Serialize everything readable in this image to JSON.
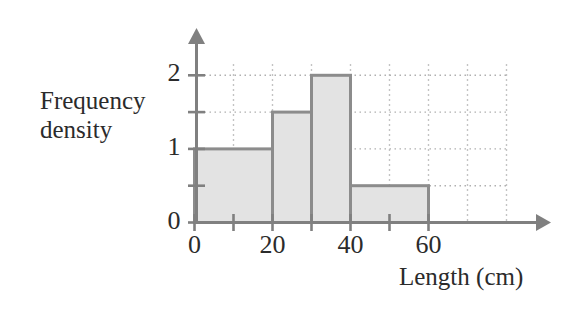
{
  "figure": {
    "background_color": "#ffffff",
    "axis_color": "#808080",
    "grid_color": "#b0b0b0",
    "bar_fill_color": "#e3e3e3",
    "bar_border_color": "#8c8c8c",
    "text_color": "#2b2b2b"
  },
  "labels": {
    "y_axis_title_line1": "Frequency",
    "y_axis_title_line2": "density",
    "x_axis_title": "Length (cm)"
  },
  "chart_data": {
    "type": "bar",
    "title": "",
    "xlabel": "Length (cm)",
    "ylabel": "Frequency density",
    "xlim": [
      0,
      80
    ],
    "ylim": [
      0,
      2.2
    ],
    "xticks": [
      0,
      20,
      40,
      60
    ],
    "xtick_labels": [
      "0",
      "20",
      "40",
      "60"
    ],
    "x_minor_ticks": [
      10,
      30,
      50
    ],
    "yticks": [
      0,
      1,
      2
    ],
    "ytick_labels": [
      "0",
      "1",
      "2"
    ],
    "y_minor_ticks": [
      0.5,
      1.5
    ],
    "grid": true,
    "grid_style": "dotted",
    "grid_x": [
      10,
      20,
      30,
      40,
      50,
      60,
      70,
      80
    ],
    "grid_y": [
      0.5,
      1,
      1.5,
      2
    ],
    "legend": null,
    "bars": [
      {
        "label": "0-20",
        "x_start": 0,
        "x_end": 20,
        "value": 1.0
      },
      {
        "label": "20-30",
        "x_start": 20,
        "x_end": 30,
        "value": 1.5
      },
      {
        "label": "30-40",
        "x_start": 30,
        "x_end": 40,
        "value": 2.0
      },
      {
        "label": "40-60",
        "x_start": 40,
        "x_end": 60,
        "value": 0.5
      }
    ]
  }
}
